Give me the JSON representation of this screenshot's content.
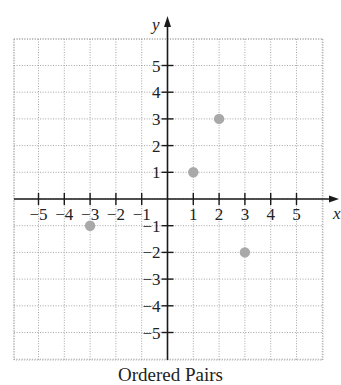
{
  "chart_data": {
    "type": "scatter",
    "title": "Ordered Pairs",
    "xlabel": "x",
    "ylabel": "y",
    "xlim": [
      -6,
      6
    ],
    "ylim": [
      -6,
      6
    ],
    "grid": true,
    "x_ticks": [
      -5,
      -4,
      -3,
      -2,
      -1,
      1,
      2,
      3,
      4,
      5
    ],
    "y_ticks": [
      5,
      4,
      3,
      2,
      1,
      -1,
      -2,
      -3,
      -4,
      -5
    ],
    "x_tick_labels": [
      "−5",
      "−4",
      "−3",
      "−2",
      "−1",
      "1",
      "2",
      "3",
      "4",
      "5"
    ],
    "y_tick_labels": [
      "5",
      "4",
      "3",
      "2",
      "1",
      "−1",
      "−2",
      "−3",
      "−4",
      "−5"
    ],
    "series": [
      {
        "name": "points",
        "points": [
          {
            "x": 1,
            "y": 1
          },
          {
            "x": 2,
            "y": 3
          },
          {
            "x": -3,
            "y": -1
          },
          {
            "x": 3,
            "y": -2
          }
        ],
        "color": "#a9a9a9"
      }
    ],
    "legend": null
  },
  "caption": "Ordered Pairs",
  "colors": {
    "axis": "#1a1a1a",
    "grid": "#9a9a9a",
    "point": "#a9a9a9"
  }
}
